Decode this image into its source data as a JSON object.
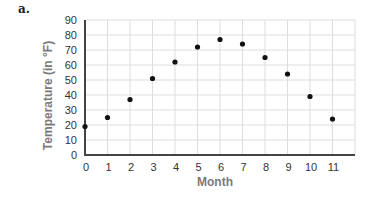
{
  "panel_label": "a.",
  "chart_data": {
    "type": "scatter",
    "title": "",
    "xlabel": "Month",
    "ylabel": "Temperature (in °F)",
    "x": [
      0,
      1,
      2,
      3,
      4,
      5,
      6,
      7,
      8,
      9,
      10,
      11
    ],
    "y": [
      19,
      25,
      37,
      51,
      62,
      72,
      77,
      74,
      65,
      54,
      39,
      24
    ],
    "xlim": [
      0,
      12
    ],
    "ylim": [
      0,
      90
    ],
    "x_ticks": [
      "0",
      "1",
      "2",
      "3",
      "4",
      "5",
      "6",
      "7",
      "8",
      "9",
      "10",
      "11"
    ],
    "y_ticks": [
      "0",
      "10",
      "20",
      "30",
      "40",
      "50",
      "60",
      "70",
      "80",
      "90"
    ],
    "grid": true,
    "legend": "none",
    "colors": {
      "point": "#111111",
      "axis": "#444444",
      "grid": "#dddddd",
      "axis_title": "#7a7a7a"
    }
  }
}
